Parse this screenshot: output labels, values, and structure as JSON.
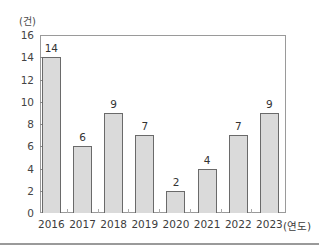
{
  "chart_data": {
    "type": "bar",
    "title": "",
    "unit_label": "(건)",
    "xlabel": "(연도)",
    "ylabel": "(건)",
    "categories": [
      "2016",
      "2017",
      "2018",
      "2019",
      "2020",
      "2021",
      "2022",
      "2023"
    ],
    "values": [
      14,
      6,
      9,
      7,
      2,
      4,
      7,
      9
    ],
    "ylim": [
      0,
      16
    ],
    "yticks": [
      0,
      2,
      4,
      6,
      8,
      10,
      12,
      14,
      16
    ],
    "grid": false,
    "legend": null,
    "data_labels": true
  },
  "colors": {
    "bar_fill": "#dadada",
    "bar_border": "#6a6a6a",
    "frame": "#9a9a9a"
  }
}
